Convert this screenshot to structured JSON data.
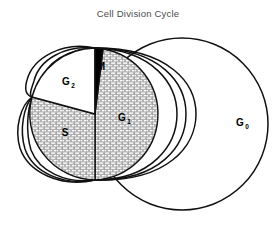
{
  "figure": {
    "title": "Cell Division Cycle",
    "type": "cell-cycle-diagram",
    "background_color": "#ffffff",
    "stroke_color": "#111111",
    "title_color": "#4a4a4a"
  },
  "phases": [
    {
      "key": "g1",
      "label": "G",
      "subscript": "1",
      "fill": "hatched-gray",
      "label_x": 122,
      "label_y": 121
    },
    {
      "key": "s",
      "label": "S",
      "subscript": "",
      "fill": "hatched-gray",
      "label_x": 65,
      "label_y": 136
    },
    {
      "key": "g2",
      "label": "G",
      "subscript": "2",
      "fill": "white",
      "label_x": 66,
      "label_y": 85
    },
    {
      "key": "m",
      "label": "M",
      "subscript": "",
      "fill": "black",
      "label_x": 101,
      "label_y": 70
    },
    {
      "key": "g0",
      "label": "G",
      "subscript": "0",
      "fill": "white",
      "label_x": 240,
      "label_y": 126
    }
  ],
  "colors": {
    "hatch_base": "#b7b7b7",
    "hatch_line": "#ffffff",
    "black_wedge": "#000000",
    "white_wedge": "#ffffff",
    "outline": "#111111"
  }
}
